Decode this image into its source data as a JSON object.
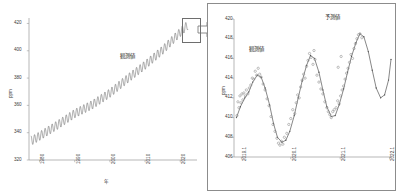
{
  "figure": {
    "title_visible": false,
    "background": "#ffffff",
    "line_color": "#6b6b6b",
    "dot_color": "#8a8a8a",
    "axis_color": "#9a9a9a",
    "border_color": "#8c8c8c"
  },
  "callout": {
    "rect_name": "zoom-region-rectangle",
    "arrow_name": "zoom-arrow"
  },
  "left_panel": {
    "annotation": "観測値",
    "xlabel": "年",
    "ylabel": "ppm",
    "xticks": [
      "1980",
      "1990",
      "2000",
      "2010",
      "2020"
    ],
    "yticks": [
      "420",
      "400",
      "380",
      "360",
      "340",
      "320"
    ]
  },
  "right_panel": {
    "annotation_observed": "観測値",
    "annotation_predicted": "予測値",
    "ylabel": "ppm",
    "xticks": [
      "2019.1",
      "2020.1",
      "2021.1",
      "2022.1"
    ],
    "yticks": [
      "420",
      "418",
      "416",
      "414",
      "412",
      "410",
      "408",
      "406"
    ]
  },
  "chart_data": [
    {
      "type": "line",
      "id": "keeling-curve-full",
      "title": "",
      "xlabel": "年",
      "ylabel": "ppm",
      "xlim": [
        1977.0,
        2022.5
      ],
      "ylim": [
        320,
        424
      ],
      "xtick_values": [
        1980,
        1990,
        2000,
        2010,
        2020
      ],
      "ytick_values": [
        320,
        340,
        360,
        380,
        400,
        420
      ],
      "grid": false,
      "legend": "none",
      "annotations": [
        {
          "text": "観測値",
          "x": 2003.0,
          "y": 385.0
        }
      ],
      "series": [
        {
          "name": "観測値",
          "description": "Monthly mean atmospheric CO2 concentration with annual seasonal cycle superposed on rising trend",
          "trend_model": "quadratic",
          "trend_points": [
            {
              "x": 1978.0,
              "y": 334.5
            },
            {
              "x": 1980.0,
              "y": 337.5
            },
            {
              "x": 1985.0,
              "y": 345.5
            },
            {
              "x": 1990.0,
              "y": 354.0
            },
            {
              "x": 1995.0,
              "y": 360.5
            },
            {
              "x": 2000.0,
              "y": 369.0
            },
            {
              "x": 2005.0,
              "y": 379.5
            },
            {
              "x": 2010.0,
              "y": 389.5
            },
            {
              "x": 2015.0,
              "y": 400.5
            },
            {
              "x": 2020.0,
              "y": 413.5
            },
            {
              "x": 2022.0,
              "y": 418.5
            }
          ],
          "seasonal_amplitude": 3.2,
          "seasonal_period_years": 1.0
        }
      ]
    },
    {
      "type": "scatter+line",
      "id": "keeling-curve-zoom",
      "title": "",
      "xlabel": "",
      "ylabel": "ppm",
      "xlim": [
        2018.95,
        2022.15
      ],
      "ylim": [
        406,
        420
      ],
      "xtick_values": [
        2019.1,
        2020.1,
        2021.1,
        2022.1
      ],
      "ytick_values": [
        406,
        408,
        410,
        412,
        414,
        416,
        418,
        420
      ],
      "grid": false,
      "legend": "none",
      "annotations": [
        {
          "text": "観測値",
          "x": 2019.33,
          "y": 416.1
        },
        {
          "text": "予測値",
          "x": 2021.0,
          "y": 419.3
        }
      ],
      "series": [
        {
          "name": "予測値",
          "style": "line",
          "points": [
            {
              "x": 2019.0,
              "y": 410.0
            },
            {
              "x": 2019.08,
              "y": 411.1
            },
            {
              "x": 2019.17,
              "y": 412.0
            },
            {
              "x": 2019.25,
              "y": 412.6
            },
            {
              "x": 2019.33,
              "y": 413.6
            },
            {
              "x": 2019.42,
              "y": 414.3
            },
            {
              "x": 2019.5,
              "y": 414.1
            },
            {
              "x": 2019.58,
              "y": 413.0
            },
            {
              "x": 2019.67,
              "y": 411.3
            },
            {
              "x": 2019.75,
              "y": 409.4
            },
            {
              "x": 2019.83,
              "y": 408.0
            },
            {
              "x": 2019.92,
              "y": 407.5
            },
            {
              "x": 2020.0,
              "y": 407.7
            },
            {
              "x": 2020.08,
              "y": 408.6
            },
            {
              "x": 2020.17,
              "y": 410.2
            },
            {
              "x": 2020.25,
              "y": 412.0
            },
            {
              "x": 2020.33,
              "y": 413.7
            },
            {
              "x": 2020.42,
              "y": 415.3
            },
            {
              "x": 2020.5,
              "y": 416.3
            },
            {
              "x": 2020.58,
              "y": 416.0
            },
            {
              "x": 2020.67,
              "y": 414.6
            },
            {
              "x": 2020.75,
              "y": 412.8
            },
            {
              "x": 2020.83,
              "y": 411.1
            },
            {
              "x": 2020.92,
              "y": 410.1
            },
            {
              "x": 2021.0,
              "y": 410.2
            },
            {
              "x": 2021.08,
              "y": 411.3
            },
            {
              "x": 2021.17,
              "y": 412.9
            },
            {
              "x": 2021.25,
              "y": 414.6
            },
            {
              "x": 2021.33,
              "y": 416.2
            },
            {
              "x": 2021.42,
              "y": 417.6
            },
            {
              "x": 2021.5,
              "y": 418.5
            },
            {
              "x": 2021.58,
              "y": 418.2
            },
            {
              "x": 2021.67,
              "y": 416.7
            },
            {
              "x": 2021.75,
              "y": 414.8
            },
            {
              "x": 2021.83,
              "y": 413.0
            },
            {
              "x": 2021.92,
              "y": 412.0
            },
            {
              "x": 2022.0,
              "y": 412.3
            },
            {
              "x": 2022.08,
              "y": 413.8
            },
            {
              "x": 2022.13,
              "y": 415.9
            }
          ]
        },
        {
          "name": "観測値",
          "style": "scatter",
          "marker": "open-circle",
          "points": [
            {
              "x": 2019.01,
              "y": 410.2
            },
            {
              "x": 2019.03,
              "y": 411.6
            },
            {
              "x": 2019.05,
              "y": 411.0
            },
            {
              "x": 2019.07,
              "y": 412.2
            },
            {
              "x": 2019.09,
              "y": 411.5
            },
            {
              "x": 2019.11,
              "y": 412.4
            },
            {
              "x": 2019.13,
              "y": 411.8
            },
            {
              "x": 2019.15,
              "y": 412.5
            },
            {
              "x": 2019.18,
              "y": 412.2
            },
            {
              "x": 2019.2,
              "y": 412.8
            },
            {
              "x": 2019.23,
              "y": 412.4
            },
            {
              "x": 2019.26,
              "y": 413.0
            },
            {
              "x": 2019.29,
              "y": 413.3
            },
            {
              "x": 2019.32,
              "y": 414.0
            },
            {
              "x": 2019.35,
              "y": 413.9
            },
            {
              "x": 2019.38,
              "y": 414.7
            },
            {
              "x": 2019.41,
              "y": 414.3
            },
            {
              "x": 2019.44,
              "y": 415.0
            },
            {
              "x": 2019.47,
              "y": 414.4
            },
            {
              "x": 2019.5,
              "y": 414.1
            },
            {
              "x": 2019.54,
              "y": 413.4
            },
            {
              "x": 2019.58,
              "y": 412.8
            },
            {
              "x": 2019.62,
              "y": 411.9
            },
            {
              "x": 2019.66,
              "y": 411.2
            },
            {
              "x": 2019.7,
              "y": 410.1
            },
            {
              "x": 2019.74,
              "y": 409.3
            },
            {
              "x": 2019.78,
              "y": 408.6
            },
            {
              "x": 2019.82,
              "y": 407.9
            },
            {
              "x": 2019.85,
              "y": 407.4
            },
            {
              "x": 2019.88,
              "y": 407.2
            },
            {
              "x": 2019.91,
              "y": 407.6
            },
            {
              "x": 2019.94,
              "y": 407.3
            },
            {
              "x": 2019.97,
              "y": 408.0
            },
            {
              "x": 2020.02,
              "y": 408.4
            },
            {
              "x": 2020.06,
              "y": 409.3
            },
            {
              "x": 2020.1,
              "y": 409.9
            },
            {
              "x": 2020.14,
              "y": 410.8
            },
            {
              "x": 2020.18,
              "y": 410.4
            },
            {
              "x": 2020.21,
              "y": 411.5
            },
            {
              "x": 2020.24,
              "y": 412.3
            },
            {
              "x": 2020.27,
              "y": 412.0
            },
            {
              "x": 2020.3,
              "y": 413.1
            },
            {
              "x": 2020.33,
              "y": 413.8
            },
            {
              "x": 2020.36,
              "y": 414.4
            },
            {
              "x": 2020.39,
              "y": 414.0
            },
            {
              "x": 2020.42,
              "y": 415.2
            },
            {
              "x": 2020.45,
              "y": 415.8
            },
            {
              "x": 2020.48,
              "y": 416.5
            },
            {
              "x": 2020.51,
              "y": 416.1
            },
            {
              "x": 2020.55,
              "y": 415.4
            },
            {
              "x": 2020.59,
              "y": 415.9
            },
            {
              "x": 2020.63,
              "y": 414.3
            },
            {
              "x": 2020.67,
              "y": 413.6
            },
            {
              "x": 2020.71,
              "y": 412.9
            },
            {
              "x": 2020.75,
              "y": 412.4
            },
            {
              "x": 2020.79,
              "y": 411.6
            },
            {
              "x": 2020.83,
              "y": 411.0
            },
            {
              "x": 2020.86,
              "y": 410.6
            },
            {
              "x": 2020.89,
              "y": 410.3
            },
            {
              "x": 2020.92,
              "y": 410.0
            },
            {
              "x": 2020.95,
              "y": 410.6
            },
            {
              "x": 2020.98,
              "y": 410.8
            },
            {
              "x": 2021.02,
              "y": 411.0
            },
            {
              "x": 2021.05,
              "y": 411.7
            },
            {
              "x": 2021.08,
              "y": 411.4
            },
            {
              "x": 2021.11,
              "y": 412.2
            },
            {
              "x": 2021.14,
              "y": 412.8
            },
            {
              "x": 2021.17,
              "y": 413.2
            },
            {
              "x": 2021.2,
              "y": 413.9
            },
            {
              "x": 2021.23,
              "y": 414.5
            },
            {
              "x": 2021.26,
              "y": 415.0
            },
            {
              "x": 2021.29,
              "y": 415.6
            },
            {
              "x": 2021.32,
              "y": 416.4
            },
            {
              "x": 2021.35,
              "y": 416.0
            },
            {
              "x": 2021.38,
              "y": 417.0
            },
            {
              "x": 2021.41,
              "y": 417.5
            },
            {
              "x": 2021.44,
              "y": 418.0
            },
            {
              "x": 2021.47,
              "y": 418.4
            },
            {
              "x": 2021.5,
              "y": 418.5
            },
            {
              "x": 2021.54,
              "y": 418.1
            },
            {
              "x": 2020.57,
              "y": 416.8
            },
            {
              "x": 2021.12,
              "y": 416.2
            },
            {
              "x": 2021.06,
              "y": 415.1
            }
          ]
        }
      ]
    }
  ]
}
